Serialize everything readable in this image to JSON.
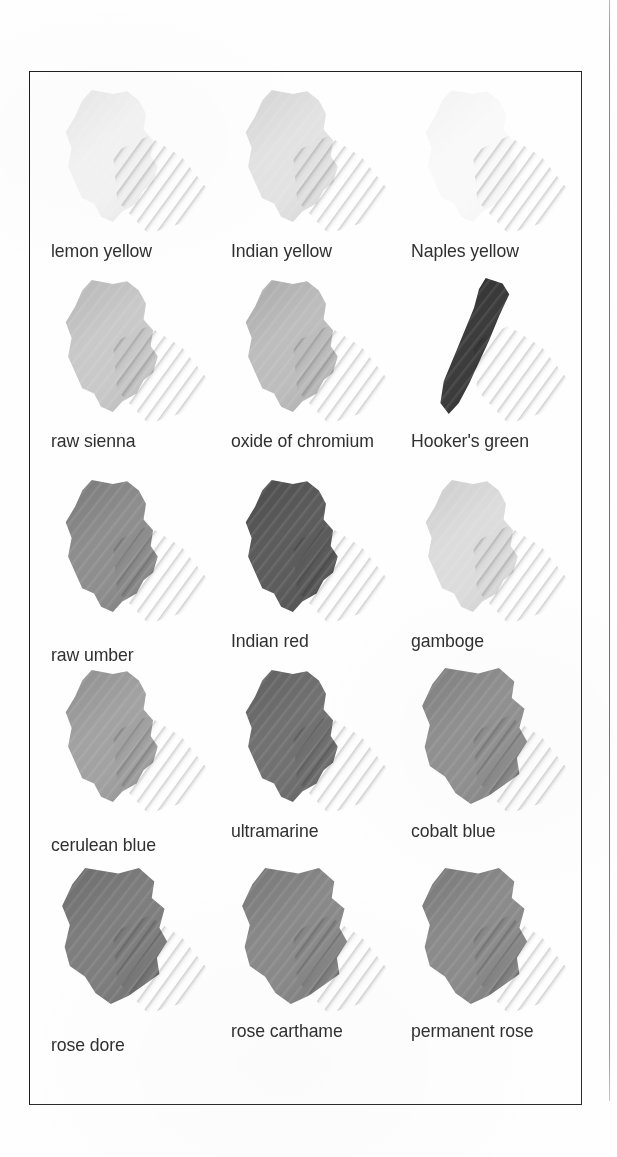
{
  "page": {
    "background_color": "#ffffff",
    "width": 617,
    "height": 1157
  },
  "gutter_rule": {
    "name": "page-gutter-rule",
    "color": "#6f6f6f"
  },
  "chart": {
    "frame_color": "#2b2b2b",
    "columns": 3,
    "rows": 5,
    "swatches": [
      {
        "label": "lemon yellow",
        "row": 1,
        "col": 1,
        "tone": "#f1f1f1",
        "tone_edge": "#e4e4e4",
        "shape": "body",
        "label_offset": 0
      },
      {
        "label": "Indian yellow",
        "row": 1,
        "col": 2,
        "tone": "#e2e2e2",
        "tone_edge": "#d2d2d2",
        "shape": "body",
        "label_offset": 0
      },
      {
        "label": "Naples yellow",
        "row": 1,
        "col": 3,
        "tone": "#f9f9f9",
        "tone_edge": "#f2f2f2",
        "shape": "wash",
        "label_offset": 0
      },
      {
        "label": "raw sienna",
        "row": 2,
        "col": 1,
        "tone": "#c9c9c9",
        "tone_edge": "#b5b5b5",
        "shape": "body",
        "label_offset": 0
      },
      {
        "label": "oxide of chromium",
        "row": 2,
        "col": 2,
        "tone": "#bdbdbd",
        "tone_edge": "#a8a8a8",
        "shape": "body",
        "label_offset": 0
      },
      {
        "label": "Hooker's green",
        "row": 2,
        "col": 3,
        "tone": "#3c3c3c",
        "tone_edge": "#2c2c2c",
        "shape": "stroke",
        "label_offset": 0
      },
      {
        "label": "raw umber",
        "row": 3,
        "col": 1,
        "tone": "#8e8e8e",
        "tone_edge": "#777777",
        "shape": "body",
        "label_offset": 14
      },
      {
        "label": "Indian red",
        "row": 3,
        "col": 2,
        "tone": "#5c5c5c",
        "tone_edge": "#4a4a4a",
        "shape": "body",
        "label_offset": 0
      },
      {
        "label": "gamboge",
        "row": 3,
        "col": 3,
        "tone": "#dcdcdc",
        "tone_edge": "#cbcbcb",
        "shape": "body",
        "label_offset": 0
      },
      {
        "label": "cerulean blue",
        "row": 4,
        "col": 1,
        "tone": "#a2a2a2",
        "tone_edge": "#8d8d8d",
        "shape": "body",
        "label_offset": 14
      },
      {
        "label": "ultramarine",
        "row": 4,
        "col": 2,
        "tone": "#717171",
        "tone_edge": "#5e5e5e",
        "shape": "body",
        "label_offset": 0
      },
      {
        "label": "cobalt blue",
        "row": 4,
        "col": 3,
        "tone": "#909090",
        "tone_edge": "#7c7c7c",
        "shape": "broad",
        "label_offset": 0
      },
      {
        "label": "rose dore",
        "row": 5,
        "col": 1,
        "tone": "#7e7e7e",
        "tone_edge": "#6a6a6a",
        "shape": "broad",
        "label_offset": 14
      },
      {
        "label": "rose carthame",
        "row": 5,
        "col": 2,
        "tone": "#898989",
        "tone_edge": "#747474",
        "shape": "broad",
        "label_offset": 0
      },
      {
        "label": "permanent rose",
        "row": 5,
        "col": 3,
        "tone": "#8b8b8b",
        "tone_edge": "#767676",
        "shape": "broad",
        "label_offset": 0
      }
    ]
  }
}
